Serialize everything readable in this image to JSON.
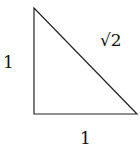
{
  "diagram": {
    "type": "right-triangle",
    "vertices": {
      "top": [
        34,
        8
      ],
      "bottom_left": [
        34,
        114
      ],
      "bottom_right": [
        137,
        114
      ]
    },
    "labels": {
      "left_side": "1",
      "hypotenuse": "√2",
      "bottom_side": "1"
    },
    "stroke_color": "#222222"
  }
}
